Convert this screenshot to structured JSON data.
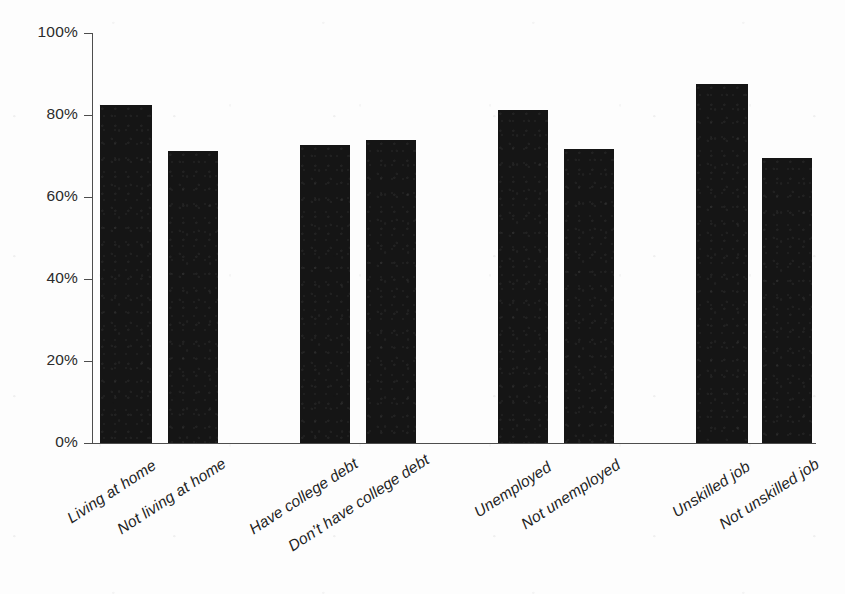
{
  "chart_data": {
    "type": "bar",
    "title": "",
    "subtitle": "",
    "xlabel": "",
    "ylabel": "",
    "ylim": [
      0,
      100
    ],
    "grid": false,
    "legend": false,
    "legend_position": "none",
    "yticks": [
      "0%",
      "20%",
      "40%",
      "60%",
      "80%",
      "100%"
    ],
    "ytick_values": [
      0,
      20,
      40,
      60,
      80,
      100
    ],
    "categories": [
      "Living at home",
      "Not living at home",
      "Have college debt",
      "Don’t have college debt",
      "Unemployed",
      "Not unemployed",
      "Unskilled job",
      "Not unskilled job"
    ],
    "values": [
      82.5,
      71.3,
      72.8,
      73.8,
      81.3,
      71.8,
      87.5,
      69.5
    ],
    "groups": [
      {
        "name": "Living at home",
        "members": [
          "Living at home",
          "Not living at home"
        ]
      },
      {
        "name": "College debt",
        "members": [
          "Have college debt",
          "Don’t have college debt"
        ]
      },
      {
        "name": "Unemployment",
        "members": [
          "Unemployed",
          "Not unemployed"
        ]
      },
      {
        "name": "Unskilled job",
        "members": [
          "Unskilled job",
          "Not unskilled job"
        ]
      }
    ],
    "bar_color": "#151515",
    "axis_color": "#4d4d4d",
    "background_color": "#ffffff"
  },
  "axis": {
    "y_ticks": [
      {
        "label": "100%",
        "value": 100
      },
      {
        "label": "80%",
        "value": 80
      },
      {
        "label": "60%",
        "value": 60
      },
      {
        "label": "40%",
        "value": 40
      },
      {
        "label": "20%",
        "value": 20
      },
      {
        "label": "0%",
        "value": 0
      }
    ]
  },
  "bars": [
    {
      "label": "Living at home",
      "value": 82.5,
      "left": 100,
      "width": 52
    },
    {
      "label": "Not living at home",
      "value": 71.3,
      "left": 168,
      "width": 50
    },
    {
      "label": "Have college debt",
      "value": 72.8,
      "left": 300,
      "width": 50
    },
    {
      "label": "Don’t have college debt",
      "value": 73.8,
      "left": 366,
      "width": 50
    },
    {
      "label": "Unemployed",
      "value": 81.3,
      "left": 498,
      "width": 50
    },
    {
      "label": "Not unemployed",
      "value": 71.8,
      "left": 564,
      "width": 50
    },
    {
      "label": "Unskilled job",
      "value": 87.5,
      "left": 696,
      "width": 52
    },
    {
      "label": "Not unskilled job",
      "value": 69.5,
      "left": 762,
      "width": 50
    }
  ]
}
